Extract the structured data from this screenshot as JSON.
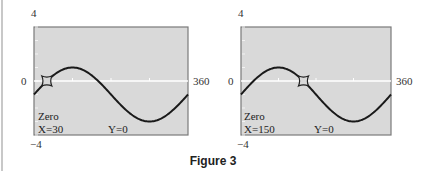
{
  "figure": {
    "caption": "Figure 3"
  },
  "chart_data": [
    {
      "type": "line",
      "title": "",
      "function": "y = 2 sin(x) - 1",
      "xlim": [
        0,
        360
      ],
      "ylim": [
        -4,
        4
      ],
      "x_tick_labels": {
        "left": "0",
        "right": "360"
      },
      "y_tick_labels": {
        "top": "4",
        "bottom": "-4"
      },
      "grid": false,
      "x": [
        0,
        30,
        60,
        90,
        120,
        150,
        180,
        210,
        240,
        270,
        300,
        330,
        360
      ],
      "y": [
        -1,
        0,
        0.73,
        1,
        0.73,
        0,
        -1,
        -2,
        -2.73,
        -3,
        -2.73,
        -2,
        -1
      ],
      "cursor": {
        "x": 30,
        "y": 0
      },
      "annotation": {
        "mode": "Zero",
        "x_readout": "X=30",
        "y_readout": "Y=0"
      }
    },
    {
      "type": "line",
      "title": "",
      "function": "y = 2 sin(x) - 1",
      "xlim": [
        0,
        360
      ],
      "ylim": [
        -4,
        4
      ],
      "x_tick_labels": {
        "left": "0",
        "right": "360"
      },
      "y_tick_labels": {
        "top": "4",
        "bottom": "-4"
      },
      "grid": false,
      "x": [
        0,
        30,
        60,
        90,
        120,
        150,
        180,
        210,
        240,
        270,
        300,
        330,
        360
      ],
      "y": [
        -1,
        0,
        0.73,
        1,
        0.73,
        0,
        -1,
        -2,
        -2.73,
        -3,
        -2.73,
        -2,
        -1
      ],
      "cursor": {
        "x": 150,
        "y": 0
      },
      "annotation": {
        "mode": "Zero",
        "x_readout": "X=150",
        "y_readout": "Y=0"
      }
    }
  ],
  "colors": {
    "plot_bg": "#d9d9d9",
    "frame": "#7a7a7a",
    "curve": "#1a1a1a",
    "axis": "#ffffff"
  }
}
